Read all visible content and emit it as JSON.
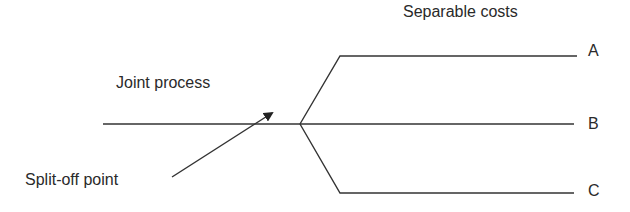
{
  "diagram": {
    "title": "Separable costs",
    "joint_label": "Joint process",
    "splitoff_label": "Split-off point",
    "products": [
      {
        "label": "A"
      },
      {
        "label": "B"
      },
      {
        "label": "C"
      }
    ],
    "line_color": "#333333"
  }
}
